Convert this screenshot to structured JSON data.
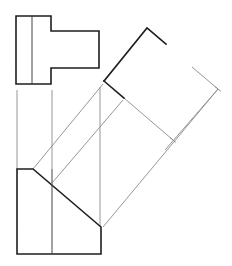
{
  "diagram": {
    "type": "orthographic-projection-auxiliary-view",
    "colors": {
      "object_line": "#1e1e1e",
      "projection_line": "#8a8a8a",
      "hidden_edge": "#444444",
      "background": "#ffffff"
    },
    "top_view": {
      "outline": [
        [
          16,
          16
        ],
        [
          51,
          16
        ],
        [
          51,
          31
        ],
        [
          99,
          31
        ],
        [
          99,
          68
        ],
        [
          51,
          68
        ],
        [
          51,
          84
        ],
        [
          16,
          84
        ]
      ],
      "inner_lines": [
        [
          [
            32,
            16
          ],
          [
            32,
            84
          ]
        ]
      ]
    },
    "front_view": {
      "outline": [
        [
          17,
          169
        ],
        [
          33,
          169
        ],
        [
          101,
          227
        ],
        [
          101,
          254
        ],
        [
          17,
          254
        ]
      ],
      "inner_lines": [
        [
          [
            52,
            169
          ],
          [
            52,
            254
          ]
        ]
      ]
    },
    "auxiliary_view": {
      "visible_edges": [
        [
          [
            104,
            81
          ],
          [
            147,
            28
          ],
          [
            166,
            44
          ]
        ],
        [
          [
            104,
            81
          ],
          [
            124,
            98
          ]
        ]
      ],
      "construction_lines": [
        [
          [
            124,
            98
          ],
          [
            173,
            140
          ]
        ],
        [
          [
            192,
            67
          ],
          [
            218,
            89
          ]
        ],
        [
          [
            218,
            89
          ],
          [
            165,
            150
          ]
        ]
      ],
      "markers": [
        [
          218,
          89
        ],
        [
          173,
          140
        ]
      ]
    },
    "projection_lines": {
      "vertical": [
        [
          [
            17,
            90
          ],
          [
            17,
            169
          ]
        ],
        [
          [
            52,
            90
          ],
          [
            52,
            169
          ]
        ],
        [
          [
            100,
            87
          ],
          [
            100,
            227
          ]
        ]
      ],
      "diagonal": [
        [
          [
            33,
            169
          ],
          [
            103,
            84
          ]
        ],
        [
          [
            52,
            183
          ],
          [
            123,
            100
          ]
        ],
        [
          [
            103,
            227
          ],
          [
            218,
            89
          ]
        ]
      ]
    }
  }
}
